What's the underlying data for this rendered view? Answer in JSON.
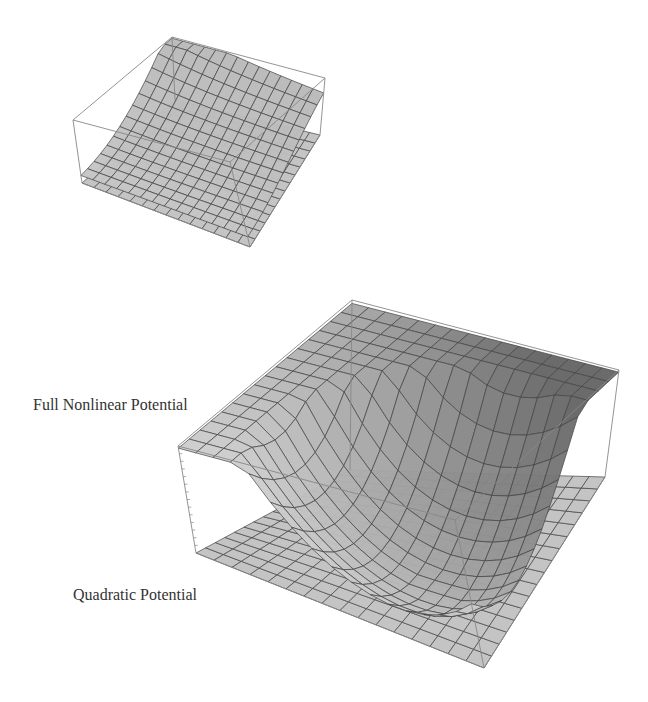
{
  "figure": {
    "labels": {
      "nonlinear": "Full Nonlinear Potential",
      "quadratic": "Quadratic Potential"
    },
    "colors": {
      "background": "#ffffff",
      "surface_light": "#d8d8d8",
      "surface_mid": "#b8b8b8",
      "surface_dark": "#707070",
      "plane": "#c4c4c4",
      "mesh": "#444444",
      "box": "#888888",
      "text": "#333333"
    },
    "small_plot": {
      "box": {
        "top_left": [
          73,
          120
        ],
        "top_back": [
          172,
          37
        ],
        "top_right": [
          325,
          78
        ],
        "top_front": [
          230,
          162
        ],
        "bot_left": [
          82,
          183
        ],
        "bot_back": [
          175,
          100
        ],
        "bot_right": [
          320,
          135
        ],
        "bot_front": [
          250,
          247
        ]
      },
      "grid": 14,
      "surface_lift": 0.55,
      "description": "Small inset: surface rising toward back-left corner above flat plane"
    },
    "large_plot": {
      "box": {
        "top_left": [
          178,
          446
        ],
        "top_back": [
          352,
          300
        ],
        "top_right": [
          619,
          370
        ],
        "top_front": [
          455,
          520
        ],
        "bot_left": [
          196,
          553
        ],
        "bot_back": [
          350,
          470
        ],
        "bot_right": [
          605,
          477
        ],
        "bot_front": [
          484,
          668
        ]
      },
      "grid": 16,
      "description": "Large plot: bowl-shaped nonlinear potential surface above flat quadratic potential plane"
    }
  }
}
